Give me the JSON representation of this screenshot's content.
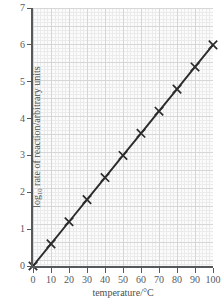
{
  "chart_data": {
    "type": "line",
    "title": "",
    "subtitle": "",
    "xlabel": "temperature/°C",
    "ylabel": "log10 rate of reaction/arbitrary units",
    "ylabel_prefix": "log",
    "ylabel_subscript": "10",
    "ylabel_suffix": " rate of reaction/arbitrary units",
    "xlim": [
      0,
      100
    ],
    "ylim": [
      0,
      7
    ],
    "xticks": [
      0,
      10,
      20,
      30,
      40,
      50,
      60,
      70,
      80,
      90,
      100
    ],
    "yticks": [
      0,
      1,
      2,
      3,
      4,
      5,
      6,
      7
    ],
    "xtick_labels": [
      "0",
      "10",
      "20",
      "30",
      "40",
      "50",
      "60",
      "70",
      "80",
      "90",
      "100"
    ],
    "ytick_labels": [
      "0",
      "1",
      "2",
      "3",
      "4",
      "5",
      "6",
      "7"
    ],
    "grid": true,
    "grid_minor": true,
    "legend": null,
    "legend_position": "none",
    "marker_style": "x",
    "line_color": "#2b2b2b",
    "grid_major_color": "#d6d6d6",
    "grid_minor_color": "#ebebeb",
    "plot_background": "#fbfbfb",
    "axis_color": "#55595c",
    "x": [
      0,
      10,
      20,
      30,
      40,
      50,
      60,
      70,
      80,
      90,
      100
    ],
    "y": [
      0,
      0.6,
      1.2,
      1.8,
      2.4,
      3.0,
      3.6,
      4.2,
      4.8,
      5.4,
      6.0
    ],
    "series": [
      {
        "name": "log10 rate of reaction",
        "x": [
          0,
          10,
          20,
          30,
          40,
          50,
          60,
          70,
          80,
          90,
          100
        ],
        "values": [
          0,
          0.6,
          1.2,
          1.8,
          2.4,
          3.0,
          3.6,
          4.2,
          4.8,
          5.4,
          6.0
        ]
      }
    ],
    "annotations": []
  }
}
